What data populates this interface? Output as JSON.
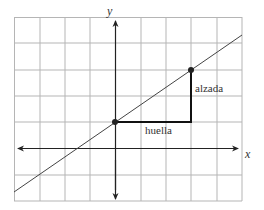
{
  "diagram": {
    "type": "coordinate-plane-slope",
    "axes": {
      "x_label": "x",
      "y_label": "y"
    },
    "grid": {
      "columns": 9,
      "rows": 7,
      "x_range": [
        -4,
        5
      ],
      "y_range": [
        -2,
        5
      ]
    },
    "line": {
      "slope": 0.6667,
      "y_intercept": 1,
      "points": [
        {
          "x": 0,
          "y": 1
        },
        {
          "x": 3,
          "y": 3
        }
      ]
    },
    "labels": {
      "run": "huella",
      "rise": "alzada"
    },
    "colors": {
      "grid": "#b5b5b5",
      "axes": "#222222",
      "line": "#444444",
      "triangle": "#111111"
    }
  }
}
